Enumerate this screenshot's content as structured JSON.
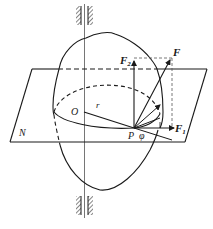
{
  "diagram": {
    "labels": {
      "force": "F",
      "force_vertical": "F",
      "force_vertical_sub": "2",
      "force_horizontal": "F",
      "force_horizontal_sub": "1",
      "center": "O",
      "radius": "r",
      "point": "P",
      "angle": "φ",
      "plane": "N"
    },
    "colors": {
      "stroke": "#1a1a1a",
      "axis": "#555555",
      "hatch": "#333333",
      "background": "#ffffff"
    }
  }
}
